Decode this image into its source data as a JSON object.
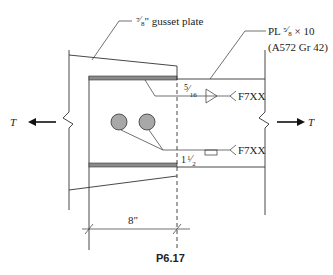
{
  "figure": {
    "caption": "P6.17",
    "gusset_label": {
      "fraction_num": "7",
      "fraction_den": "8",
      "text": "\" gusset plate"
    },
    "plate_label": {
      "line1_prefix": "PL ",
      "fraction_num": "5",
      "fraction_den": "8",
      "line1_suffix": " × 10",
      "line2": "(A572 Gr 42)"
    },
    "weld_top": {
      "size_num": "5",
      "size_den": "16",
      "electrode": "F7XX"
    },
    "weld_bottom": {
      "size_whole": "1",
      "size_num": "1",
      "size_den": "2",
      "electrode": "F7XX"
    },
    "force_left": "T",
    "force_right": "T",
    "dimension": "8\""
  },
  "colors": {
    "line": "#333333",
    "weld_fill": "#8a8a8a",
    "bolt_fill": "#a8a8a8"
  }
}
